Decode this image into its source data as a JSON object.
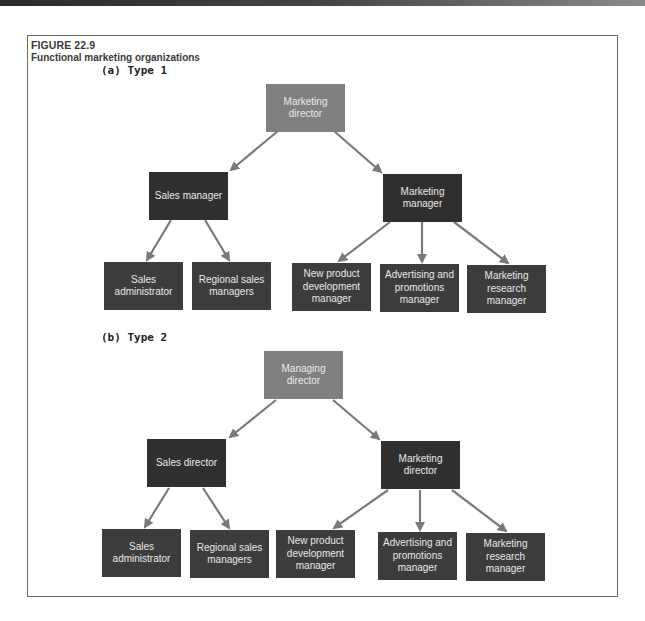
{
  "figure": {
    "number": "FIGURE 22.9",
    "title": "Functional marketing organizations"
  },
  "colors": {
    "top_node": "#808080",
    "manager_node": "#2f2f2f",
    "leaf_node": "#3c3c3c",
    "arrow": "#7a7a7a",
    "frame": "#6a6a6a"
  },
  "type1": {
    "label": "(a) Type 1",
    "root": "Marketing director",
    "sales_head": "Sales manager",
    "marketing_head": "Marketing manager",
    "sales_children": [
      "Sales administrator",
      "Regional sales managers"
    ],
    "marketing_children": [
      "New product development manager",
      "Advertising and promotions manager",
      "Marketing research manager"
    ]
  },
  "type2": {
    "label": "(b) Type 2",
    "root": "Managing director",
    "sales_head": "Sales director",
    "marketing_head": "Marketing director",
    "sales_children": [
      "Sales administrator",
      "Regional sales managers"
    ],
    "marketing_children": [
      "New product development manager",
      "Advertising and promotions manager",
      "Marketing research manager"
    ]
  }
}
